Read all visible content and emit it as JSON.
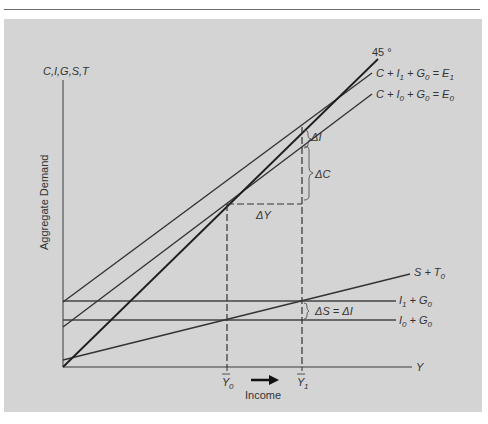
{
  "figure": {
    "y_axis_label": "C,I,G,S,T",
    "y_axis_title": "Aggregate Demand",
    "x_axis_label": "Y",
    "x_axis_title": "Income",
    "arrow": "→"
  },
  "lines": {
    "forty_five": {
      "label": "45 °"
    },
    "e1": {
      "label_parts": [
        "C + I",
        "1",
        " + G",
        "0",
        " = E",
        "1"
      ]
    },
    "e0": {
      "label_parts": [
        "C + I",
        "0",
        " + G",
        "0",
        " = E",
        "0"
      ]
    },
    "s_t": {
      "label_parts": [
        "S + T",
        "0"
      ]
    },
    "i1g0": {
      "label_parts": [
        "I",
        "1",
        " + G",
        "0"
      ]
    },
    "i0g0": {
      "label_parts": [
        "I",
        "0",
        " + G",
        "0"
      ]
    }
  },
  "annotations": {
    "delta_i": "ΔI",
    "delta_c": "ΔC",
    "delta_y": "ΔY",
    "delta_s_eq_delta_i": "ΔS = ΔI"
  },
  "ticks": {
    "y0": {
      "base": "Y",
      "sub": "0"
    },
    "y1": {
      "base": "Y",
      "sub": "1"
    }
  },
  "colors": {
    "panel": "#d4d4d4",
    "line": "#2e2e2e",
    "thin_line": "#4a4a4a"
  }
}
